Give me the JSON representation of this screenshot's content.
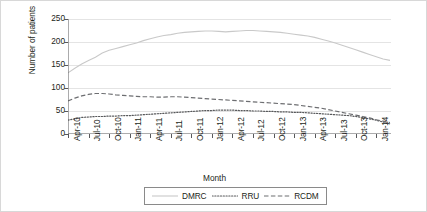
{
  "chart_data": {
    "type": "line",
    "title": "",
    "xlabel": "Month",
    "ylabel": "Number of patients",
    "ylim": [
      0,
      250
    ],
    "yticks": [
      0,
      50,
      100,
      150,
      200,
      250
    ],
    "grid": true,
    "legend_position": "bottom-center",
    "x": [
      "Apr-10",
      "May-10",
      "Jun-10",
      "Jul-10",
      "Aug-10",
      "Sep-10",
      "Oct-10",
      "Nov-10",
      "Dec-10",
      "Jan-11",
      "Feb-11",
      "Mar-11",
      "Apr-11",
      "May-11",
      "Jun-11",
      "Jul-11",
      "Aug-11",
      "Sep-11",
      "Oct-11",
      "Nov-11",
      "Dec-11",
      "Jan-12",
      "Feb-12",
      "Mar-12",
      "Apr-12",
      "May-12",
      "Jun-12",
      "Jul-12",
      "Aug-12",
      "Sep-12",
      "Oct-12",
      "Nov-12",
      "Dec-12",
      "Jan-13",
      "Feb-13",
      "Mar-13",
      "Apr-13",
      "May-13",
      "Jun-13",
      "Jul-13",
      "Aug-13",
      "Sep-13",
      "Oct-13",
      "Nov-13",
      "Dec-13",
      "Jan-14",
      "Feb-14",
      "Mar-14"
    ],
    "xtick_labels": [
      "Apr-10",
      "Jul-10",
      "Oct-10",
      "Jan-11",
      "Apr-11",
      "Jul-11",
      "Oct-11",
      "Jan-12",
      "Apr-12",
      "Jul-12",
      "Oct-12",
      "Jan-13",
      "Apr-13",
      "Jul-13",
      "Oct-13",
      "Jan-14"
    ],
    "xtick_indices": [
      0,
      3,
      6,
      9,
      12,
      15,
      18,
      21,
      24,
      27,
      30,
      33,
      36,
      39,
      42,
      45
    ],
    "series": [
      {
        "name": "DMRC",
        "style": "solid",
        "color": "#c9c9c9",
        "values": [
          133,
          143,
          152,
          160,
          167,
          176,
          182,
          186,
          190,
          194,
          198,
          203,
          207,
          211,
          214,
          216,
          219,
          221,
          222,
          223,
          224,
          224,
          223,
          222,
          223,
          224,
          225,
          225,
          224,
          223,
          222,
          221,
          219,
          217,
          215,
          213,
          210,
          206,
          202,
          198,
          193,
          188,
          183,
          178,
          173,
          168,
          163,
          160
        ]
      },
      {
        "name": "RRU",
        "style": "dotted",
        "color": "#58595b",
        "values": [
          30,
          33,
          36,
          37,
          38,
          38,
          39,
          39,
          40,
          40,
          41,
          42,
          43,
          44,
          45,
          46,
          47,
          48,
          49,
          50,
          51,
          51,
          52,
          52,
          52,
          51,
          51,
          50,
          50,
          49,
          49,
          48,
          48,
          47,
          47,
          46,
          45,
          44,
          43,
          42,
          41,
          40,
          38,
          36,
          33,
          30,
          26,
          22
        ]
      },
      {
        "name": "RCDM",
        "style": "dashed",
        "color": "#6d6e71",
        "values": [
          72,
          78,
          83,
          86,
          88,
          88,
          87,
          85,
          84,
          83,
          82,
          81,
          81,
          80,
          80,
          81,
          81,
          80,
          79,
          78,
          77,
          76,
          75,
          74,
          73,
          72,
          71,
          70,
          69,
          68,
          67,
          66,
          65,
          64,
          62,
          60,
          58,
          56,
          53,
          50,
          47,
          44,
          41,
          38,
          35,
          31,
          28,
          25
        ]
      }
    ]
  },
  "legend": {
    "items": [
      {
        "label": "DMRC"
      },
      {
        "label": "RRU"
      },
      {
        "label": "RCDM"
      }
    ]
  }
}
